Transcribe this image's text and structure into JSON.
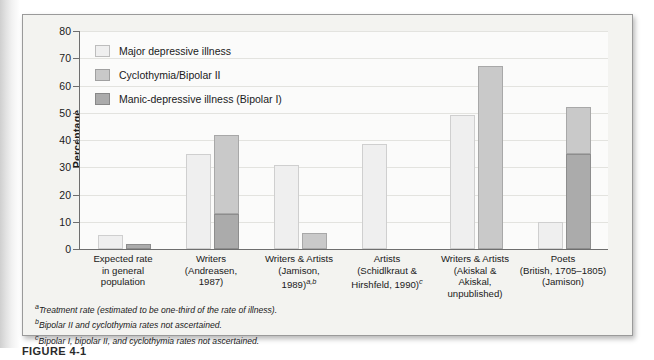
{
  "figure": {
    "caption": "FIGURE 4-1"
  },
  "chart_data": {
    "type": "bar",
    "title": "",
    "xlabel": "",
    "ylabel": "Percentage",
    "ylim": [
      0,
      80
    ],
    "yticks": [
      0,
      10,
      20,
      30,
      40,
      50,
      60,
      70,
      80
    ],
    "grid": true,
    "legend_position": "top-left",
    "categories": [
      "Expected rate\nin general\npopulation",
      "Writers\n(Andreasen,\n1987)",
      "Writers & Artists\n(Jamison,\n1989)",
      "Artists\n(Schidlkraut &\nHirshfeld, 1990)",
      "Writers & Artists\n(Akiskal &\nAkiskal,\nunpublished)",
      "Poets\n(British, 1705–1805)\n(Jamison)"
    ],
    "series": [
      {
        "name": "Major depressive illness",
        "color": "#efefef",
        "values": [
          5,
          35,
          31,
          38.5,
          49,
          10
        ]
      },
      {
        "name": "Cyclothymia/Bipolar II",
        "color": "#c9c9c9",
        "values": [
          0,
          42,
          6,
          0,
          67,
          52
        ]
      },
      {
        "name": "Manic-depressive illness (Bipolar I)",
        "color": "#ababab",
        "values": [
          2,
          13,
          0,
          0,
          0,
          35
        ]
      }
    ],
    "note": "Series 2 and 3 are drawn as a single stacked column per group; the Bipolar I value is the dark lower segment and the Cyclothymia/Bipolar II value is the total column top."
  },
  "legend": {
    "items": [
      {
        "label": "Major depressive illness",
        "swatch": "major"
      },
      {
        "label": "Cyclothymia/Bipolar II",
        "swatch": "cyclo"
      },
      {
        "label": "Manic-depressive illness (Bipolar I)",
        "swatch": "manic"
      }
    ]
  },
  "yaxis": {
    "title": "Percentage",
    "ticks": [
      "80",
      "70",
      "60",
      "50",
      "40",
      "30",
      "20",
      "10",
      "0"
    ]
  },
  "xaxis": {
    "groups": [
      {
        "line1": "Expected rate",
        "line2": "in general",
        "line3": "population",
        "line4": "",
        "sup": ""
      },
      {
        "line1": "Writers",
        "line2": "(Andreasen,",
        "line3": "1987)",
        "line4": "",
        "sup": ""
      },
      {
        "line1": "Writers & Artists",
        "line2": "(Jamison,",
        "line3": "1989)",
        "line4": "",
        "sup": "a,b"
      },
      {
        "line1": "Artists",
        "line2": "(Schidlkraut &",
        "line3": "Hirshfeld, 1990)",
        "line4": "",
        "sup": "c"
      },
      {
        "line1": "Writers & Artists",
        "line2": "(Akiskal &",
        "line3": "Akiskal,",
        "line4": "unpublished)",
        "sup": ""
      },
      {
        "line1": "Poets",
        "line2": "(British, 1705–1805)",
        "line3": "(Jamison)",
        "line4": "",
        "sup": ""
      }
    ]
  },
  "footnotes": [
    {
      "marker": "a",
      "text": "Treatment rate (estimated to be one-third of the rate of illness)."
    },
    {
      "marker": "b",
      "text": "Bipolar II and cyclothymia rates not ascertained."
    },
    {
      "marker": "c",
      "text": "Bipolar I, bipolar II, and cyclothymia rates not ascertained."
    }
  ]
}
